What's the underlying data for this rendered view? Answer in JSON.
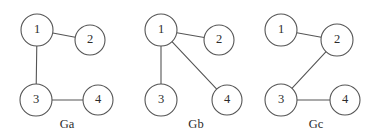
{
  "figure": {
    "name": "graph-isomorphism-figure",
    "width": 380,
    "height": 138,
    "background_color": "#ffffff",
    "stroke_color": "#555555",
    "text_color": "#2b2b2b"
  },
  "graphs": [
    {
      "caption": "Ga",
      "caption_x": 67,
      "caption_y": 125,
      "nodes": [
        {
          "label": "1",
          "x": 37,
          "y": 30,
          "r": 16
        },
        {
          "label": "2",
          "x": 90,
          "y": 40,
          "r": 15
        },
        {
          "label": "3",
          "x": 36,
          "y": 100,
          "r": 16
        },
        {
          "label": "4",
          "x": 98,
          "y": 100,
          "r": 15
        }
      ],
      "edges": [
        {
          "from": 0,
          "to": 1
        },
        {
          "from": 0,
          "to": 2
        },
        {
          "from": 2,
          "to": 3
        }
      ]
    },
    {
      "caption": "Gb",
      "caption_x": 196,
      "caption_y": 125,
      "nodes": [
        {
          "label": "1",
          "x": 161,
          "y": 30,
          "r": 16
        },
        {
          "label": "2",
          "x": 219,
          "y": 40,
          "r": 15
        },
        {
          "label": "3",
          "x": 161,
          "y": 100,
          "r": 16
        },
        {
          "label": "4",
          "x": 227,
          "y": 100,
          "r": 15
        }
      ],
      "edges": [
        {
          "from": 0,
          "to": 1
        },
        {
          "from": 0,
          "to": 2
        },
        {
          "from": 0,
          "to": 3
        }
      ]
    },
    {
      "caption": "Gc",
      "caption_x": 316,
      "caption_y": 125,
      "nodes": [
        {
          "label": "1",
          "x": 281,
          "y": 30,
          "r": 16
        },
        {
          "label": "2",
          "x": 337,
          "y": 40,
          "r": 16
        },
        {
          "label": "3",
          "x": 281,
          "y": 100,
          "r": 16
        },
        {
          "label": "4",
          "x": 345,
          "y": 100,
          "r": 15
        }
      ],
      "edges": [
        {
          "from": 0,
          "to": 1
        },
        {
          "from": 1,
          "to": 2
        },
        {
          "from": 2,
          "to": 3
        }
      ]
    }
  ]
}
